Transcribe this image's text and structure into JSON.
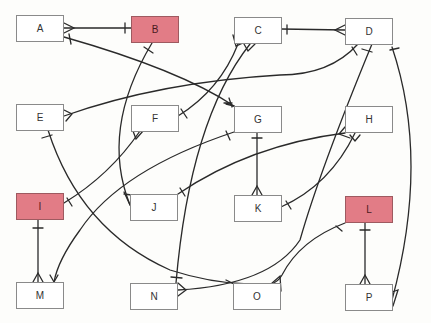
{
  "diagram": {
    "type": "entity-relationship",
    "highlight_color": "#e27c86",
    "entities": [
      {
        "id": "A",
        "label": "A",
        "x": 16,
        "y": 15,
        "highlighted": false
      },
      {
        "id": "B",
        "label": "B",
        "x": 131,
        "y": 16,
        "highlighted": true
      },
      {
        "id": "C",
        "label": "C",
        "x": 234,
        "y": 17,
        "highlighted": false
      },
      {
        "id": "D",
        "label": "D",
        "x": 345,
        "y": 18,
        "highlighted": false
      },
      {
        "id": "E",
        "label": "E",
        "x": 16,
        "y": 104,
        "highlighted": false
      },
      {
        "id": "F",
        "label": "F",
        "x": 131,
        "y": 105,
        "highlighted": false
      },
      {
        "id": "G",
        "label": "G",
        "x": 234,
        "y": 106,
        "highlighted": false
      },
      {
        "id": "H",
        "label": "H",
        "x": 345,
        "y": 106,
        "highlighted": false
      },
      {
        "id": "I",
        "label": "I",
        "x": 16,
        "y": 193,
        "highlighted": true
      },
      {
        "id": "J",
        "label": "J",
        "x": 130,
        "y": 194,
        "highlighted": false
      },
      {
        "id": "K",
        "label": "K",
        "x": 234,
        "y": 195,
        "highlighted": false
      },
      {
        "id": "L",
        "label": "L",
        "x": 345,
        "y": 196,
        "highlighted": true
      },
      {
        "id": "M",
        "label": "M",
        "x": 16,
        "y": 282,
        "highlighted": false
      },
      {
        "id": "N",
        "label": "N",
        "x": 130,
        "y": 283,
        "highlighted": false
      },
      {
        "id": "O",
        "label": "O",
        "x": 233,
        "y": 283,
        "highlighted": false
      },
      {
        "id": "P",
        "label": "P",
        "x": 345,
        "y": 284,
        "highlighted": false
      }
    ],
    "relationships": [
      {
        "from": "A",
        "from_card": "many",
        "to": "B",
        "to_card": "one"
      },
      {
        "from": "A",
        "from_card": "one",
        "to": "G",
        "to_card": "many"
      },
      {
        "from": "B",
        "from_card": "one",
        "to": "J",
        "to_card": "many"
      },
      {
        "from": "C",
        "from_card": "one",
        "to": "D",
        "to_card": "many"
      },
      {
        "from": "C",
        "from_card": "many",
        "to": "F",
        "to_card": "one"
      },
      {
        "from": "C",
        "from_card": "many",
        "to": "N",
        "to_card": "one"
      },
      {
        "from": "D",
        "from_card": "one",
        "to": "E",
        "to_card": "many"
      },
      {
        "from": "D",
        "from_card": "one",
        "to": "N",
        "to_card": "many"
      },
      {
        "from": "D",
        "from_card": "one",
        "to": "P",
        "to_card": "many"
      },
      {
        "from": "E",
        "from_card": "one",
        "to": "O",
        "to_card": "many"
      },
      {
        "from": "F",
        "from_card": "many",
        "to": "I",
        "to_card": "one"
      },
      {
        "from": "G",
        "from_card": "one",
        "to": "M",
        "to_card": "many"
      },
      {
        "from": "G",
        "from_card": "one",
        "to": "K",
        "to_card": "many"
      },
      {
        "from": "H",
        "from_card": "many",
        "to": "J",
        "to_card": "one"
      },
      {
        "from": "H",
        "from_card": "many",
        "to": "K",
        "to_card": "one"
      },
      {
        "from": "I",
        "from_card": "one",
        "to": "M",
        "to_card": "many"
      },
      {
        "from": "L",
        "from_card": "one",
        "to": "O",
        "to_card": "many"
      },
      {
        "from": "L",
        "from_card": "one",
        "to": "P",
        "to_card": "many"
      }
    ]
  }
}
